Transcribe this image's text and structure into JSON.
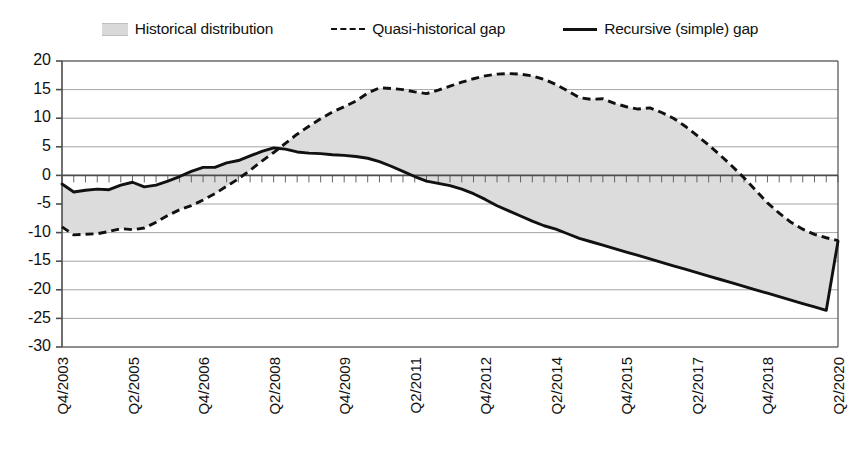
{
  "legend": {
    "entries": [
      {
        "label": "Historical distribution",
        "marker": "band-swatch",
        "color": "#dcdcdc"
      },
      {
        "label": "Quasi-historical gap",
        "marker": "dashed-line",
        "color": "#111111"
      },
      {
        "label": "Recursive (simple) gap",
        "marker": "solid-line",
        "color": "#111111"
      }
    ]
  },
  "chart_data": {
    "type": "line",
    "title": "",
    "subtitle": "",
    "xlabel": "",
    "ylabel": "",
    "ylim": [
      -30,
      20
    ],
    "ytick_step": 5,
    "yticks": [
      20,
      15,
      10,
      5,
      0,
      -5,
      -10,
      -15,
      -20,
      -25,
      -30
    ],
    "ytick_labels": [
      "20",
      "15",
      "10",
      "5",
      "0",
      "-5",
      "-10",
      "-15",
      "-20",
      "-25",
      "-30"
    ],
    "grid": true,
    "grid_axis": "y",
    "legend_position": "top",
    "band_fill": "#dcdcdc",
    "band_description": "Historical distribution shaded between the quasi-historical gap and the recursive (simple) gap",
    "x_tick_labels": [
      "Q4/2003",
      "Q2/2005",
      "Q4/2006",
      "Q2/2008",
      "Q4/2009",
      "Q2/2011",
      "Q4/2012",
      "Q2/2014",
      "Q4/2015",
      "Q2/2017",
      "Q4/2018",
      "Q2/2020"
    ],
    "x_tick_label_rotation": -90,
    "x_tick_label_interval_quarters": 6,
    "x_minor_ticks": "quarterly",
    "x": [
      "Q4/2003",
      "Q1/2004",
      "Q2/2004",
      "Q3/2004",
      "Q4/2004",
      "Q1/2005",
      "Q2/2005",
      "Q3/2005",
      "Q4/2005",
      "Q1/2006",
      "Q2/2006",
      "Q3/2006",
      "Q4/2006",
      "Q1/2007",
      "Q2/2007",
      "Q3/2007",
      "Q4/2007",
      "Q1/2008",
      "Q2/2008",
      "Q3/2008",
      "Q4/2008",
      "Q1/2009",
      "Q2/2009",
      "Q3/2009",
      "Q4/2009",
      "Q1/2010",
      "Q2/2010",
      "Q3/2010",
      "Q4/2010",
      "Q1/2011",
      "Q2/2011",
      "Q3/2011",
      "Q4/2011",
      "Q1/2012",
      "Q2/2012",
      "Q3/2012",
      "Q4/2012",
      "Q1/2013",
      "Q2/2013",
      "Q3/2013",
      "Q4/2013",
      "Q1/2014",
      "Q2/2014",
      "Q3/2014",
      "Q4/2014",
      "Q1/2015",
      "Q2/2015",
      "Q3/2015",
      "Q4/2015",
      "Q1/2016",
      "Q2/2016",
      "Q3/2016",
      "Q4/2016",
      "Q1/2017",
      "Q2/2017",
      "Q3/2017",
      "Q4/2017",
      "Q1/2018",
      "Q2/2018",
      "Q3/2018",
      "Q4/2018",
      "Q1/2019",
      "Q2/2019",
      "Q3/2019",
      "Q4/2019",
      "Q1/2020",
      "Q2/2020"
    ],
    "series": [
      {
        "name": "Quasi-historical gap",
        "style": "dashed",
        "color": "#111111",
        "values": [
          -9.0,
          -10.4,
          -10.3,
          -10.2,
          -9.8,
          -9.3,
          -9.5,
          -9.2,
          -8.2,
          -7.0,
          -6.0,
          -5.3,
          -4.3,
          -3.2,
          -1.9,
          -0.6,
          0.9,
          2.5,
          4.0,
          5.6,
          7.2,
          8.6,
          9.9,
          11.1,
          12.0,
          13.0,
          14.4,
          15.3,
          15.2,
          15.0,
          14.6,
          14.3,
          14.9,
          15.6,
          16.3,
          16.9,
          17.4,
          17.7,
          17.8,
          17.7,
          17.4,
          16.8,
          15.9,
          14.8,
          13.6,
          13.3,
          13.4,
          12.6,
          12.0,
          11.6,
          11.8,
          11.0,
          10.0,
          8.6,
          7.0,
          5.3,
          3.5,
          1.6,
          -0.4,
          -2.6,
          -4.8,
          -6.6,
          -8.2,
          -9.4,
          -10.3,
          -10.9,
          -11.4
        ]
      },
      {
        "name": "Recursive (simple) gap",
        "style": "solid",
        "color": "#111111",
        "values": [
          -1.5,
          -2.9,
          -2.6,
          -2.4,
          -2.5,
          -1.7,
          -1.2,
          -2.0,
          -1.7,
          -1.0,
          -0.2,
          0.7,
          1.4,
          1.4,
          2.2,
          2.6,
          3.4,
          4.2,
          4.8,
          4.6,
          4.1,
          3.9,
          3.8,
          3.6,
          3.5,
          3.3,
          3.0,
          2.4,
          1.6,
          0.7,
          -0.2,
          -1.0,
          -1.4,
          -1.8,
          -2.4,
          -3.2,
          -4.2,
          -5.3,
          -6.2,
          -7.1,
          -8.0,
          -8.8,
          -9.4,
          -10.2,
          -11.0,
          -11.6,
          -12.2,
          -12.8,
          -13.4,
          -14.0,
          -14.6,
          -15.2,
          -15.8,
          -16.4,
          -17.0,
          -17.6,
          -18.2,
          -18.8,
          -19.4,
          -20.0,
          -20.6,
          -21.2,
          -21.8,
          -22.4,
          -23.0,
          -23.6,
          -11.5
        ]
      }
    ]
  }
}
